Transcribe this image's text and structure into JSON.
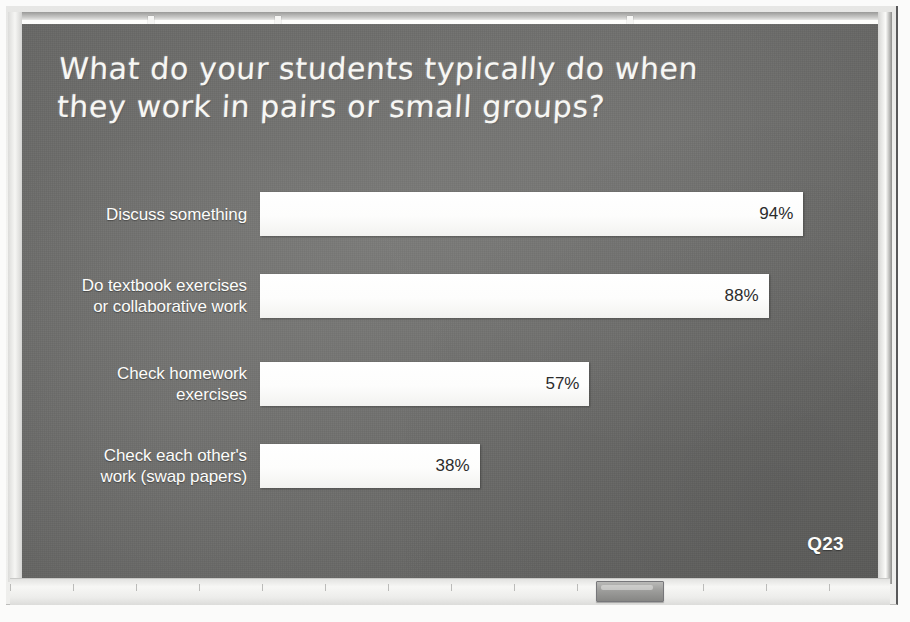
{
  "slide": {
    "title_line1": "What do your students typically do when",
    "title_line2": "they work in pairs or small groups?",
    "question_tag": "Q23"
  },
  "board": {
    "surface_color": "#6d6d6b",
    "chalk_color": "#f7f7f4",
    "bar_color": "#ffffff",
    "frame_color": "#eeeeec"
  },
  "icons": {
    "eraser": "eraser-icon",
    "clip_left": "board-clip-icon",
    "clip_mid": "board-clip-icon",
    "clip_right": "board-clip-icon"
  },
  "chart_data": {
    "type": "bar",
    "orientation": "horizontal",
    "title": "What do your students typically do when they work in pairs or small groups?",
    "subtitle": "",
    "xlabel": "",
    "ylabel": "",
    "xlim": [
      0,
      100
    ],
    "grid": false,
    "legend": false,
    "value_suffix": "%",
    "categories": [
      "Discuss something",
      "Do textbook exercises or collaborative work",
      "Check homework exercises",
      "Check each other's work (swap papers)"
    ],
    "values": [
      94,
      88,
      57,
      38
    ],
    "labels": [
      "94%",
      "88%",
      "57%",
      "38%"
    ],
    "rows": [
      {
        "label_line1": "Discuss something",
        "label_line2": "",
        "value": 94,
        "value_label": "94%"
      },
      {
        "label_line1": "Do textbook exercises",
        "label_line2": "or collaborative work",
        "value": 88,
        "value_label": "88%"
      },
      {
        "label_line1": "Check homework",
        "label_line2": "exercises",
        "value": 57,
        "value_label": "57%"
      },
      {
        "label_line1": "Check each other's",
        "label_line2": "work (swap papers)",
        "value": 38,
        "value_label": "38%"
      }
    ]
  }
}
